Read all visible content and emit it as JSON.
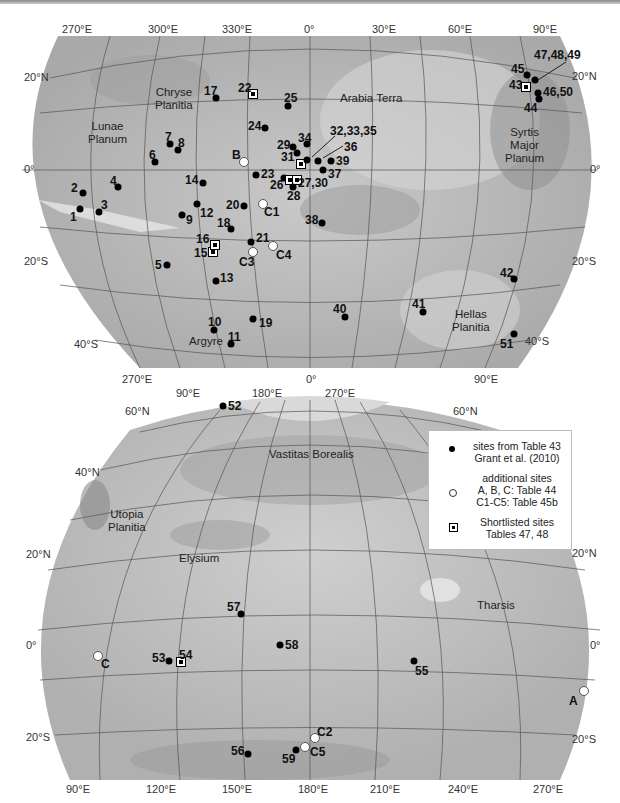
{
  "top_map": {
    "lon_ticks": [
      "270°E",
      "300°E",
      "330°E",
      "0°",
      "30°E",
      "60°E",
      "90°E"
    ],
    "lat_ticks_left": [
      "20°N",
      "0°",
      "20°S",
      "40°S"
    ],
    "lat_ticks_right": [
      "20°N",
      "0°",
      "20°S",
      "40°S"
    ],
    "bottom_ticks": [
      "270°E",
      "0°",
      "90°E"
    ],
    "regions": {
      "chryse": "Chryse\nPlanitia",
      "lunae": "Lunae\nPlanum",
      "arabia": "Arabia  Terra",
      "syrtis": "Syrtis\nMajor\nPlanum",
      "hellas": "Hellas\nPlanitia",
      "argyre": "Argyre"
    },
    "sites": [
      "1",
      "2",
      "3",
      "4",
      "5",
      "6",
      "7",
      "8",
      "9",
      "10",
      "11",
      "12",
      "13",
      "14",
      "15",
      "16",
      "17",
      "18",
      "19",
      "20",
      "21",
      "22",
      "23",
      "24",
      "25",
      "26",
      "27,30",
      "28",
      "29",
      "31",
      "32,33,35",
      "34",
      "36",
      "37",
      "38",
      "39",
      "40",
      "41",
      "42",
      "43",
      "44",
      "45",
      "46,50",
      "47,48,49",
      "51"
    ],
    "additional_sites": [
      "B",
      "C1",
      "C3",
      "C4"
    ]
  },
  "bottom_map": {
    "lon_ticks_top": [
      "90°E",
      "180°E",
      "270°E"
    ],
    "lat_ticks_left": [
      "60°N",
      "40°N",
      "20°N",
      "0°",
      "20°S"
    ],
    "lat_ticks_right": [
      "60°N",
      "20°N",
      "0°",
      "20°S"
    ],
    "bottom_ticks": [
      "90°E",
      "120°E",
      "150°E",
      "180°E",
      "210°E",
      "240°E",
      "270°E"
    ],
    "regions": {
      "vastitas": "Vastitas  Borealis",
      "utopia": "Utopia\nPlanitia",
      "elysium": "Elysium",
      "tharsis": "Tharsis"
    },
    "sites": [
      "52",
      "53",
      "54",
      "55",
      "56",
      "57",
      "58",
      "59"
    ],
    "additional_sites": [
      "A",
      "C",
      "C2",
      "C5"
    ]
  },
  "legend": {
    "items": [
      {
        "symbol": "filled-dot",
        "text": "sites from Table 43\nGrant et al. (2010)"
      },
      {
        "symbol": "open-dot",
        "text": "additional sites\nA, B, C: Table 44\nC1-C5: Table 45b"
      },
      {
        "symbol": "boxed-dot",
        "text": "Shortlisted sites\nTables 47, 48"
      }
    ]
  }
}
